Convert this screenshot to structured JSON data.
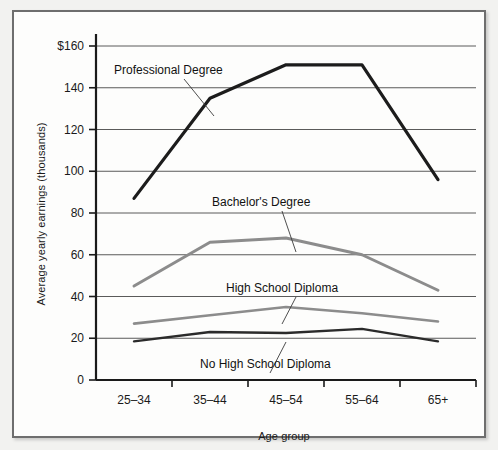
{
  "chart_data": {
    "type": "line",
    "title": "",
    "xlabel": "Age group",
    "ylabel": "Average yearly earnings (thousands)",
    "categories": [
      "25–34",
      "35–44",
      "45–54",
      "55–64",
      "65+"
    ],
    "ylim": [
      0,
      160
    ],
    "ytick_values": [
      0,
      20,
      40,
      60,
      80,
      100,
      120,
      140,
      160
    ],
    "ytick_labels": [
      "0",
      "20",
      "40",
      "60",
      "80",
      "100",
      "120",
      "140",
      "$160"
    ],
    "grid": "horizontal",
    "legend": "inline-annotations",
    "series": [
      {
        "name": "Professional Degree",
        "color": "#1c1c1c",
        "width": 3.2,
        "values": [
          87,
          135,
          151,
          151,
          96
        ]
      },
      {
        "name": "Bachelor's Degree",
        "color": "#8c8c8c",
        "width": 3.0,
        "values": [
          45,
          66,
          68,
          60,
          43
        ]
      },
      {
        "name": "High School Diploma",
        "color": "#8c8c8c",
        "width": 2.6,
        "values": [
          27,
          31,
          35,
          32,
          28
        ]
      },
      {
        "name": "No High School Diploma",
        "color": "#2b2b2b",
        "width": 2.4,
        "values": [
          18.5,
          23,
          22.5,
          24.5,
          18.5
        ]
      }
    ],
    "annotations": [
      {
        "text": "Professional Degree",
        "label_x": 100,
        "label_y": 62,
        "leader_to_x": 200,
        "leader_to_y": 104
      },
      {
        "text": "Bachelor's Degree",
        "label_x": 198,
        "label_y": 194,
        "leader_to_x": 282,
        "leader_to_y": 240
      },
      {
        "text": "High School Diploma",
        "label_x": 212,
        "label_y": 280,
        "leader_to_x": 268,
        "leader_to_y": 312
      },
      {
        "text": "No High School Diploma",
        "label_x": 186,
        "label_y": 356,
        "leader_to_x": 272,
        "leader_to_y": 330
      }
    ]
  }
}
